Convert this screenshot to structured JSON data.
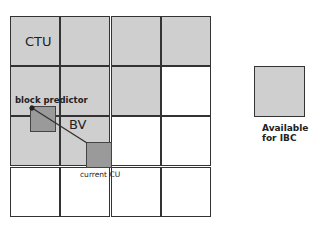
{
  "diagram": {
    "ctu_label": "CTU",
    "block_predictor_label": "block predictor",
    "bv_label": "BV",
    "current_cu_label": "current CU",
    "grid": {
      "rows": 4,
      "cols": 4,
      "available_color": "#cfcfcf",
      "unavailable_color": "#ffffff",
      "cells": [
        [
          1,
          1,
          1,
          1
        ],
        [
          1,
          1,
          1,
          0
        ],
        [
          1,
          1,
          0,
          0
        ],
        [
          0,
          0,
          0,
          0
        ]
      ]
    },
    "block_color": "#9a9a9a"
  },
  "legend": {
    "line1": "Available",
    "line2": "for IBC",
    "color": "#cfcfcf"
  }
}
